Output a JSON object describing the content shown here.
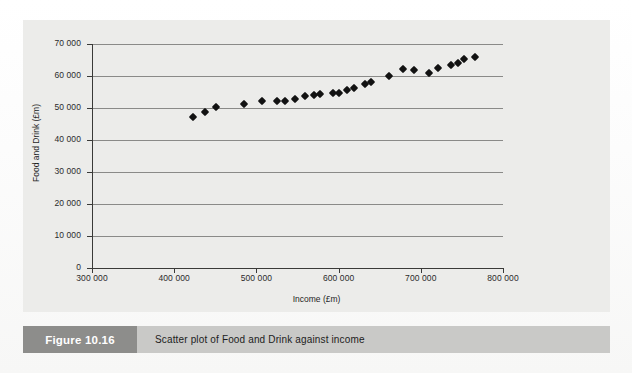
{
  "figure": {
    "tag": "Figure 10.16",
    "caption": "Scatter plot of Food and Drink against income"
  },
  "colors": {
    "plot_background": "#ececea",
    "gridline": "#8a8a88",
    "axis": "#3a3a38",
    "marker": "#121212",
    "caption_tag_bg": "#8d8d8b",
    "caption_bar_bg": "#c9c9c7"
  },
  "chart_data": {
    "type": "scatter",
    "title": "",
    "xlabel": "Income (£m)",
    "ylabel": "Food and Drink (£m)",
    "xlim": [
      300000,
      800000
    ],
    "ylim": [
      0,
      70000
    ],
    "xticks": [
      300000,
      400000,
      500000,
      600000,
      700000,
      800000
    ],
    "xticklabels": [
      "300 000",
      "400 000",
      "500 000",
      "600 000",
      "700 000",
      "800 000"
    ],
    "yticks": [
      0,
      10000,
      20000,
      30000,
      40000,
      50000,
      60000,
      70000
    ],
    "yticklabels": [
      "0",
      "10 000",
      "20 000",
      "30 000",
      "40 000",
      "50 000",
      "60 000",
      "70 000"
    ],
    "grid": "horizontal",
    "legend": null,
    "marker_style": "filled-diamond",
    "series": [
      {
        "name": "Food and Drink vs Income",
        "points": [
          [
            422900,
            47200
          ],
          [
            437400,
            48600
          ],
          [
            450900,
            50300
          ],
          [
            484800,
            51200
          ],
          [
            506700,
            52200
          ],
          [
            525000,
            52200
          ],
          [
            534700,
            52200
          ],
          [
            546900,
            52800
          ],
          [
            558900,
            53800
          ],
          [
            569800,
            54200
          ],
          [
            577100,
            54400
          ],
          [
            600200,
            54700
          ],
          [
            618400,
            56200
          ],
          [
            631800,
            57500
          ],
          [
            639100,
            58100
          ],
          [
            660900,
            60000
          ],
          [
            678000,
            62200
          ],
          [
            709400,
            61000
          ],
          [
            721500,
            62500
          ],
          [
            737200,
            63400
          ],
          [
            752000,
            65300
          ],
          [
            766500,
            66000
          ],
          [
            592900,
            54600
          ],
          [
            610000,
            55600
          ],
          [
            692000,
            62000
          ],
          [
            745000,
            64200
          ]
        ]
      }
    ]
  },
  "ghost_lines": [
    "the underlying page text shows faintly through the paper",
    "and is not part of the figure itself"
  ]
}
